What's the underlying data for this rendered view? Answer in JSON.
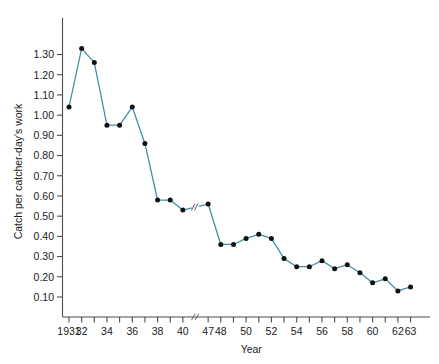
{
  "chart_data": {
    "type": "line",
    "title": "",
    "xlabel": "Year",
    "ylabel": "Catch per catcher-day's work",
    "ylim": [
      0.0,
      1.37
    ],
    "grid": false,
    "legend": null,
    "line_color": "#3f8fa3",
    "marker_color": "#111111",
    "axis_color": "#4d4d4d",
    "y_ticks": [
      "0.10",
      "0.20",
      "0.30",
      "0.40",
      "0.50",
      "0.60",
      "0.70",
      "0.80",
      "0.90",
      "1.00",
      "1.10",
      "1.20",
      "1.30"
    ],
    "y_tick_values": [
      0.1,
      0.2,
      0.3,
      0.4,
      0.5,
      0.6,
      0.7,
      0.8,
      0.9,
      1.0,
      1.1,
      1.2,
      1.3
    ],
    "x_tick_labels": [
      "1931",
      "32",
      "34",
      "36",
      "38",
      "40",
      "47",
      "48",
      "50",
      "52",
      "54",
      "56",
      "58",
      "60",
      "62",
      "63"
    ],
    "x_tick_label_years": [
      1931,
      1932,
      1934,
      1936,
      1938,
      1940,
      1947,
      1948,
      1950,
      1952,
      1954,
      1956,
      1958,
      1960,
      1962,
      1963
    ],
    "axis_break": {
      "present": true,
      "between": [
        1940,
        1947
      ],
      "symbol": "//"
    },
    "x": [
      1931,
      1932,
      1933,
      1934,
      1935,
      1936,
      1937,
      1938,
      1939,
      1940,
      1947,
      1948,
      1949,
      1950,
      1951,
      1952,
      1953,
      1954,
      1955,
      1956,
      1957,
      1958,
      1959,
      1960,
      1961,
      1962,
      1963
    ],
    "values": [
      1.04,
      1.33,
      1.26,
      0.95,
      0.95,
      1.04,
      0.86,
      0.58,
      0.58,
      0.53,
      0.56,
      0.36,
      0.36,
      0.39,
      0.41,
      0.39,
      0.29,
      0.25,
      0.25,
      0.28,
      0.24,
      0.26,
      0.22,
      0.17,
      0.19,
      0.13,
      0.15
    ],
    "series": [
      {
        "name": "Catch per catcher-day's work",
        "values": [
          1.04,
          1.33,
          1.26,
          0.95,
          0.95,
          1.04,
          0.86,
          0.58,
          0.58,
          0.53,
          0.56,
          0.36,
          0.36,
          0.39,
          0.41,
          0.39,
          0.29,
          0.25,
          0.25,
          0.28,
          0.24,
          0.26,
          0.22,
          0.17,
          0.19,
          0.13,
          0.15
        ]
      }
    ]
  }
}
